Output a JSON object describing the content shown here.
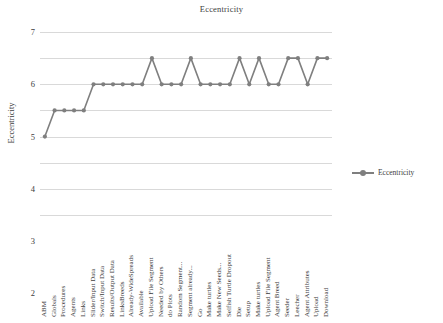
{
  "chart_data": {
    "type": "line",
    "title": "Eccentricity",
    "xlabel": "",
    "ylabel": "Eccentricity",
    "ylim": [
      0,
      7
    ],
    "yticks": [
      0,
      1,
      2,
      3,
      4,
      5,
      6,
      7
    ],
    "grid": true,
    "legend_position": "right",
    "legend": [
      "Eccentricity"
    ],
    "series_name": "Eccentricity",
    "series_color": "#7f7f7f",
    "categories": [
      "ABM",
      "Globals",
      "Procedures",
      "Agents",
      "Links",
      "Slider/Input Data",
      "Switch/Input Data",
      "Results/Output Data",
      "LinksBreeds",
      "Already-WideSpreads",
      "Available",
      "Upload File Segment",
      "Needed by Others",
      "do Plots",
      "Random Segment...",
      "Segment already...",
      "Go",
      "Make turtles",
      "Make New Seeds...",
      "Selfish Turtle Dropout",
      "Die",
      "Setup",
      "Make turtles",
      "Upload File Segment",
      "Agent Breed",
      "Seeder",
      "Leecher",
      "Agent Attributes",
      "Upload",
      "Download"
    ],
    "values": [
      3,
      4,
      4,
      4,
      4,
      5,
      5,
      5,
      5,
      5,
      5,
      6,
      5,
      5,
      5,
      6,
      5,
      5,
      5,
      5,
      6,
      5,
      6,
      5,
      5,
      6,
      6,
      5,
      6,
      6
    ]
  }
}
